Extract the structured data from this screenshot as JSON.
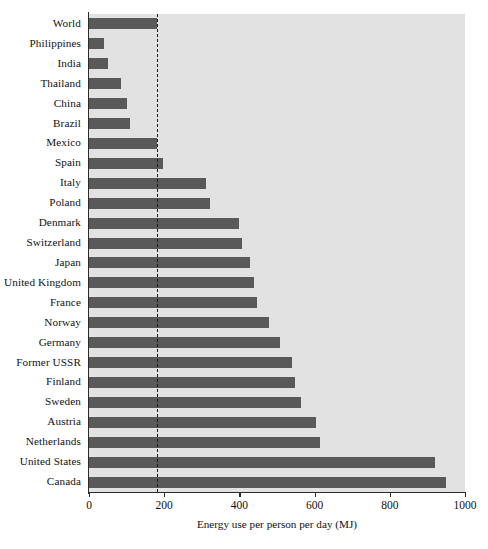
{
  "chart_data": {
    "type": "bar",
    "orientation": "horizontal",
    "title": "",
    "xlabel": "Energy use per person per day (MJ)",
    "ylabel": "",
    "xlim": [
      0,
      1000
    ],
    "xticks": [
      0,
      200,
      400,
      600,
      800,
      1000
    ],
    "xticklabels": [
      "0",
      "200",
      "400",
      "600",
      "800",
      "1000"
    ],
    "grid": false,
    "legend": null,
    "reference_line": {
      "value": 180,
      "style": "dashed",
      "color": "#171717",
      "label": ""
    },
    "colors": {
      "bar": "#595959",
      "plot_background": "#e2e2e2",
      "axis": "#2b2b2b",
      "text": "#111111"
    },
    "categories": [
      "World",
      "Philippines",
      "India",
      "Thailand",
      "China",
      "Brazil",
      "Mexico",
      "Spain",
      "Italy",
      "Poland",
      "Denmark",
      "Switzerland",
      "Japan",
      "United Kingdom",
      "France",
      "Norway",
      "Germany",
      "Former USSR",
      "Finland",
      "Sweden",
      "Austria",
      "Netherlands",
      "United States",
      "Canada"
    ],
    "values": [
      180,
      40,
      50,
      85,
      102,
      108,
      180,
      198,
      310,
      322,
      400,
      408,
      428,
      440,
      446,
      480,
      508,
      540,
      548,
      565,
      605,
      615,
      920,
      950
    ]
  }
}
